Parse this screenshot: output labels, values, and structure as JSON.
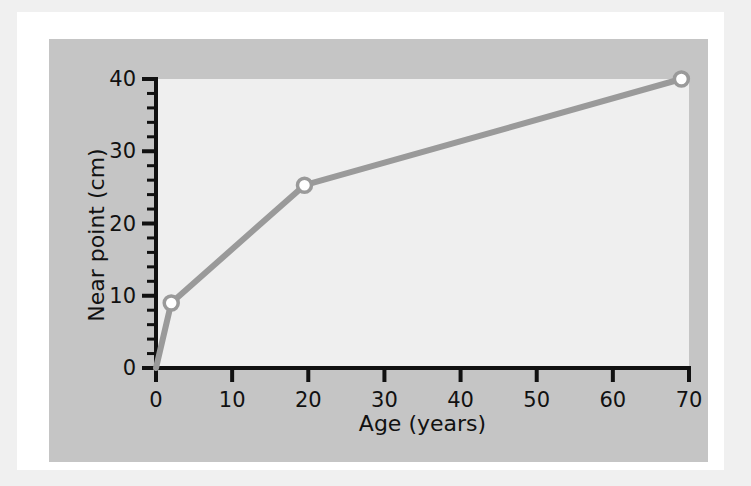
{
  "chart_data": {
    "type": "line",
    "title": "",
    "xlabel": "Age (years)",
    "ylabel": "Near point (cm)",
    "xlim": [
      0,
      70
    ],
    "ylim": [
      0,
      40
    ],
    "x_ticks": [
      0,
      10,
      20,
      30,
      40,
      50,
      60,
      70
    ],
    "x_tick_labels": [
      "0",
      "10",
      "20",
      "30",
      "40",
      "50",
      "60",
      "70"
    ],
    "y_ticks": [
      0,
      10,
      20,
      30,
      40
    ],
    "y_tick_labels": [
      "0",
      "10",
      "20",
      "30",
      "40"
    ],
    "y_minor_tick_step": 2,
    "x_minor_ticks": false,
    "grid": false,
    "legend": "none",
    "series": [
      {
        "name": "Near point",
        "marker": "open-circle",
        "line_color": "#9a9a9a",
        "marker_face_color": "#ffffff",
        "marker_edge_color": "#9a9a9a",
        "x": [
          0,
          2,
          19.5,
          69
        ],
        "y": [
          0,
          9,
          25.3,
          40
        ]
      }
    ],
    "data_points": [
      {
        "age": 2,
        "near_point": 9
      },
      {
        "age": 19.5,
        "near_point": 25.3
      },
      {
        "age": 69,
        "near_point": 40
      }
    ]
  },
  "colors": {
    "page_background": "#f0f0f0",
    "mat": "#ffffff",
    "figure_panel": "#c5c5c5",
    "plot_area": "#efefef",
    "axis": "#111111",
    "line": "#9a9a9a",
    "marker_fill": "#ffffff",
    "tick_label": "#111111"
  },
  "axis_titles": {
    "x": "Age (years)",
    "y": "Near point (cm)"
  }
}
